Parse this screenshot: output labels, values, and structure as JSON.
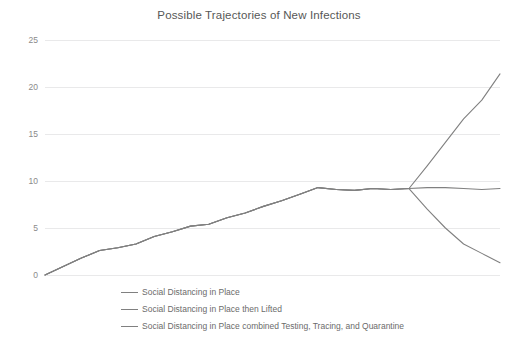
{
  "chart_data": {
    "type": "line",
    "title": "Possible Trajectories of New Infections",
    "xlabel": "",
    "ylabel": "",
    "ylim": [
      0,
      25
    ],
    "xlim": [
      0,
      100
    ],
    "yticks": [
      0,
      5,
      10,
      15,
      20,
      25
    ],
    "ytick_labels": [
      "0",
      "5",
      "10",
      "15",
      "20",
      "25"
    ],
    "grid": true,
    "xaxis_visible": false,
    "legend_position": "bottom",
    "line_color": "#808080",
    "gridline_color": "#e9e9ea",
    "title_color": "#575757",
    "tick_color": "#8a8a8a",
    "series": [
      {
        "name": "Social Distancing in Place",
        "x": [
          0,
          4,
          8,
          12,
          16,
          20,
          24,
          28,
          32,
          36,
          40,
          44,
          48,
          52,
          56,
          60,
          64,
          68,
          72,
          76,
          80,
          84,
          88,
          92,
          96,
          100
        ],
        "values": [
          0.0,
          0.9,
          1.8,
          2.6,
          2.9,
          3.3,
          4.1,
          4.6,
          5.2,
          5.4,
          6.1,
          6.6,
          7.3,
          7.9,
          8.6,
          9.3,
          9.1,
          9.0,
          9.2,
          9.1,
          9.2,
          9.3,
          9.3,
          9.2,
          9.1,
          9.2
        ]
      },
      {
        "name": "Social Distancing in Place then Lifted",
        "x": [
          0,
          4,
          8,
          12,
          16,
          20,
          24,
          28,
          32,
          36,
          40,
          44,
          48,
          52,
          56,
          60,
          64,
          68,
          72,
          76,
          80,
          84,
          88,
          92,
          96,
          100
        ],
        "values": [
          0.0,
          0.9,
          1.8,
          2.6,
          2.9,
          3.3,
          4.1,
          4.6,
          5.2,
          5.4,
          6.1,
          6.6,
          7.3,
          7.9,
          8.6,
          9.3,
          9.1,
          9.0,
          9.2,
          9.1,
          9.2,
          11.6,
          14.1,
          16.6,
          18.6,
          21.4
        ]
      },
      {
        "name": "Social Distancing in Place combined Testing, Tracing, and Quarantine",
        "x": [
          0,
          4,
          8,
          12,
          16,
          20,
          24,
          28,
          32,
          36,
          40,
          44,
          48,
          52,
          56,
          60,
          64,
          68,
          72,
          76,
          80,
          84,
          88,
          92,
          96,
          100
        ],
        "values": [
          0.0,
          0.9,
          1.8,
          2.6,
          2.9,
          3.3,
          4.1,
          4.6,
          5.2,
          5.4,
          6.1,
          6.6,
          7.3,
          7.9,
          8.6,
          9.3,
          9.1,
          9.0,
          9.2,
          9.1,
          9.2,
          7.0,
          5.0,
          3.3,
          2.3,
          1.3
        ]
      }
    ],
    "legend": [
      "Social Distancing in Place",
      "Social Distancing in Place then Lifted",
      "Social Distancing in Place combined Testing, Tracing, and Quarantine"
    ]
  }
}
